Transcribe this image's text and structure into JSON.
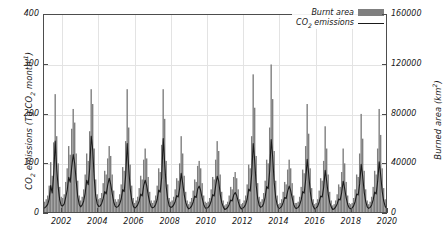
{
  "chart_data": {
    "type": "line",
    "title": "",
    "subtitle": "",
    "xlabel": "",
    "ylabel": "CO2 emissions (Tg CO2 month-1)",
    "ylabel_right": "Burned area (km2)",
    "xlim": [
      2001.0,
      2020.0
    ],
    "ylim": [
      0,
      400
    ],
    "ylim_right": [
      0,
      160000
    ],
    "grid": true,
    "legend_position": "top-right",
    "legend": [
      "Burnt area",
      "CO2 emissions"
    ],
    "colors": {
      "burnt_area_bar": "#7f7f7f",
      "co2_line": "#1a1a1a",
      "axis": "#4d4d4d",
      "grid": "#e3e3e3",
      "background": "#ffffff"
    },
    "xticks": [
      2002,
      2004,
      2006,
      2008,
      2010,
      2012,
      2014,
      2016,
      2018,
      2020
    ],
    "yticks_left": [
      0,
      100,
      200,
      300,
      400
    ],
    "yticks_right": [
      0,
      40000,
      80000,
      120000,
      160000
    ],
    "x_start_year": 2001,
    "x_step_months": 1,
    "series": [
      {
        "name": "Burnt area",
        "axis": "right",
        "render": "bar",
        "units": "km2",
        "values": [
          9000,
          11000,
          14000,
          22000,
          41000,
          30000,
          57000,
          96000,
          62000,
          40000,
          21000,
          13000,
          12000,
          15000,
          25000,
          36000,
          54000,
          47000,
          68000,
          84000,
          73000,
          48000,
          26000,
          14000,
          10000,
          13000,
          19000,
          31000,
          48000,
          42000,
          66000,
          100000,
          88000,
          52000,
          27000,
          15000,
          11000,
          12000,
          16000,
          24000,
          34000,
          31000,
          44000,
          54000,
          46000,
          31000,
          18000,
          11000,
          9000,
          11000,
          15000,
          23000,
          37000,
          34000,
          58000,
          100000,
          69000,
          39000,
          22000,
          12000,
          8000,
          10000,
          13000,
          20000,
          30000,
          27000,
          43000,
          52000,
          44000,
          29000,
          17000,
          10000,
          8000,
          10000,
          14000,
          22000,
          36000,
          33000,
          55000,
          100000,
          76000,
          42000,
          23000,
          12000,
          9000,
          10000,
          13000,
          19000,
          28000,
          26000,
          40000,
          62000,
          48000,
          30000,
          17000,
          10000,
          7000,
          9000,
          12000,
          18000,
          27000,
          25000,
          38000,
          42000,
          36000,
          24000,
          14000,
          9000,
          8000,
          9000,
          12000,
          19000,
          29000,
          27000,
          43000,
          58000,
          50000,
          31000,
          17000,
          10000,
          6000,
          7000,
          9000,
          14000,
          21000,
          19000,
          29000,
          33000,
          28000,
          19000,
          11000,
          7000,
          8000,
          10000,
          14000,
          23000,
          39000,
          36000,
          62000,
          112000,
          85000,
          46000,
          24000,
          13000,
          9000,
          11000,
          16000,
          26000,
          43000,
          40000,
          69000,
          120000,
          92000,
          50000,
          26000,
          14000,
          7000,
          8000,
          11000,
          17000,
          25000,
          23000,
          35000,
          43000,
          36000,
          24000,
          14000,
          8000,
          8000,
          9000,
          13000,
          21000,
          35000,
          32000,
          54000,
          88000,
          64000,
          36000,
          20000,
          11000,
          7000,
          8000,
          11000,
          18000,
          28000,
          26000,
          42000,
          70000,
          52000,
          31000,
          17000,
          10000,
          6000,
          7000,
          10000,
          15000,
          23000,
          21000,
          33000,
          52000,
          40000,
          25000,
          14000,
          8000,
          7000,
          8000,
          12000,
          19000,
          31000,
          29000,
          48000,
          80000,
          60000,
          34000,
          19000,
          10000,
          7000,
          9000,
          13000,
          21000,
          34000,
          31000,
          52000,
          84000,
          63000,
          36000,
          20000,
          11000,
          8000,
          10000,
          14000,
          22000,
          33000,
          30000,
          48000,
          70000,
          122000,
          58000,
          28000,
          14000
        ]
      },
      {
        "name": "CO2 emissions",
        "axis": "left",
        "render": "line",
        "units": "Tg CO2 month-1",
        "values": [
          10,
          13,
          17,
          28,
          55,
          40,
          78,
          145,
          88,
          52,
          26,
          15,
          14,
          18,
          31,
          46,
          72,
          62,
          92,
          118,
          100,
          64,
          33,
          17,
          12,
          16,
          24,
          40,
          66,
          57,
          90,
          155,
          128,
          70,
          34,
          18,
          13,
          14,
          19,
          29,
          43,
          38,
          56,
          70,
          58,
          39,
          22,
          13,
          11,
          13,
          18,
          28,
          47,
          43,
          76,
          140,
          90,
          49,
          27,
          14,
          9,
          12,
          16,
          24,
          38,
          34,
          55,
          66,
          55,
          36,
          21,
          12,
          10,
          12,
          17,
          27,
          46,
          42,
          72,
          150,
          100,
          53,
          28,
          14,
          11,
          12,
          16,
          23,
          35,
          32,
          50,
          80,
          60,
          37,
          21,
          12,
          8,
          10,
          14,
          22,
          34,
          31,
          48,
          54,
          45,
          29,
          17,
          10,
          9,
          11,
          15,
          24,
          37,
          34,
          55,
          74,
          64,
          38,
          21,
          12,
          7,
          8,
          11,
          17,
          26,
          24,
          36,
          41,
          35,
          23,
          13,
          8,
          9,
          12,
          17,
          28,
          48,
          44,
          78,
          140,
          106,
          56,
          29,
          15,
          11,
          13,
          19,
          32,
          53,
          49,
          85,
          148,
          113,
          61,
          31,
          16,
          8,
          10,
          13,
          21,
          31,
          29,
          44,
          54,
          45,
          30,
          17,
          10,
          9,
          11,
          16,
          26,
          43,
          40,
          67,
          108,
          79,
          44,
          24,
          13,
          8,
          10,
          13,
          22,
          34,
          32,
          52,
          86,
          64,
          38,
          21,
          12,
          7,
          8,
          12,
          18,
          28,
          26,
          41,
          64,
          49,
          30,
          17,
          10,
          8,
          10,
          14,
          23,
          38,
          36,
          59,
          98,
          74,
          42,
          23,
          12,
          9,
          11,
          16,
          26,
          42,
          38,
          64,
          103,
          77,
          44,
          24,
          13,
          9,
          12,
          17,
          27,
          40,
          37,
          59,
          86,
          148,
          71,
          34,
          17
        ]
      }
    ]
  },
  "axes": {
    "left_title_parts": {
      "p1": "CO",
      "p2": "2",
      "p3": " emissions (Tg CO",
      "p4": "2",
      "p5": " month",
      "p6": "-1",
      "p7": ")"
    },
    "right_title_parts": {
      "p1": "Burned area (km",
      "p2": "2",
      "p3": ")"
    }
  },
  "legend": {
    "burnt_area_label": "Burnt area",
    "co2_label_p1": "CO",
    "co2_label_sub": "2",
    "co2_label_p2": " emissions"
  }
}
